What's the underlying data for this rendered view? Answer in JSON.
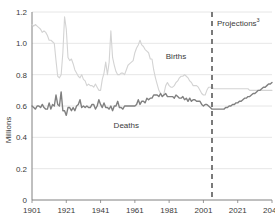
{
  "chart_data": {
    "type": "line",
    "title": "",
    "subtitle": "",
    "xlabel": "",
    "ylabel": "Millions",
    "xlim": [
      1901,
      2041
    ],
    "ylim": [
      0,
      1.2
    ],
    "grid": true,
    "grid_axis": "y",
    "legend": "inline-labels",
    "x_ticks": [
      "1901",
      "1921",
      "1941",
      "1961",
      "1981",
      "2001",
      "2021",
      "2041"
    ],
    "x_tick_values": [
      1901,
      1921,
      1941,
      1961,
      1981,
      2001,
      2021,
      2041
    ],
    "y_ticks": [
      "0",
      "0.2",
      "0.4",
      "0.6",
      "0.8",
      "1.0",
      "1.2"
    ],
    "y_tick_values": [
      0,
      0.2,
      0.4,
      0.6,
      0.8,
      1.0,
      1.2
    ],
    "annotations": [
      {
        "name": "projections-divider",
        "text": "Projections",
        "superscript": "3",
        "x": 2006,
        "style": "dashed-vertical",
        "color": "#7a7a7a"
      },
      {
        "name": "births-label",
        "text": "Births",
        "x": 1985,
        "y": 0.9,
        "color": "#3a3a3a"
      },
      {
        "name": "deaths-label",
        "text": "Deaths",
        "x": 1956,
        "y": 0.46,
        "color": "#3a3a3a"
      }
    ],
    "colors": {
      "births": "#d3d3d3",
      "deaths": "#808080",
      "grid": "#e0e0e0",
      "axis": "#808080",
      "text": "#3a3a3a",
      "background": "#ffffff"
    },
    "series": [
      {
        "name": "Births",
        "color": "#d3d3d3",
        "x": [
          1901,
          1902,
          1903,
          1904,
          1905,
          1906,
          1907,
          1908,
          1909,
          1910,
          1911,
          1912,
          1913,
          1914,
          1915,
          1916,
          1917,
          1918,
          1919,
          1920,
          1921,
          1922,
          1923,
          1924,
          1925,
          1926,
          1927,
          1928,
          1929,
          1930,
          1931,
          1932,
          1933,
          1934,
          1935,
          1936,
          1937,
          1938,
          1939,
          1940,
          1941,
          1942,
          1943,
          1944,
          1945,
          1946,
          1947,
          1948,
          1949,
          1950,
          1951,
          1952,
          1953,
          1954,
          1955,
          1956,
          1957,
          1958,
          1959,
          1960,
          1961,
          1962,
          1963,
          1964,
          1965,
          1966,
          1967,
          1968,
          1969,
          1970,
          1971,
          1972,
          1973,
          1974,
          1975,
          1976,
          1977,
          1978,
          1979,
          1980,
          1981,
          1982,
          1983,
          1984,
          1985,
          1986,
          1987,
          1988,
          1989,
          1990,
          1991,
          1992,
          1993,
          1994,
          1995,
          1996,
          1997,
          1998,
          1999,
          2000,
          2001,
          2002,
          2003,
          2004,
          2005,
          2006,
          2007,
          2008,
          2009,
          2010,
          2011,
          2012,
          2013,
          2014,
          2015,
          2016,
          2017,
          2018,
          2019,
          2020,
          2021,
          2022,
          2023,
          2024,
          2025,
          2026,
          2027,
          2028,
          2029,
          2030,
          2031,
          2032,
          2033,
          2034,
          2035,
          2036,
          2037,
          2038,
          2039,
          2040,
          2041
        ],
        "values": [
          1.12,
          1.11,
          1.12,
          1.11,
          1.1,
          1.09,
          1.07,
          1.08,
          1.07,
          1.05,
          1.02,
          1.02,
          1.01,
          1.0,
          0.89,
          0.79,
          0.78,
          0.8,
          0.94,
          1.17,
          1.09,
          0.91,
          0.89,
          0.9,
          0.87,
          0.83,
          0.81,
          0.79,
          0.78,
          0.8,
          0.77,
          0.76,
          0.73,
          0.74,
          0.73,
          0.73,
          0.72,
          0.74,
          0.72,
          0.7,
          0.7,
          0.77,
          0.81,
          0.88,
          0.8,
          0.88,
          1.08,
          0.91,
          0.86,
          0.82,
          0.8,
          0.8,
          0.81,
          0.81,
          0.8,
          0.83,
          0.86,
          0.87,
          0.88,
          0.89,
          0.94,
          0.97,
          0.99,
          1.02,
          0.99,
          0.98,
          0.96,
          0.95,
          0.94,
          0.9,
          0.9,
          0.83,
          0.78,
          0.74,
          0.7,
          0.68,
          0.66,
          0.68,
          0.73,
          0.75,
          0.73,
          0.72,
          0.72,
          0.73,
          0.75,
          0.76,
          0.78,
          0.79,
          0.79,
          0.8,
          0.79,
          0.78,
          0.76,
          0.75,
          0.73,
          0.73,
          0.73,
          0.72,
          0.7,
          0.68,
          0.67,
          0.67,
          0.7,
          0.72,
          0.72,
          0.72,
          0.71,
          0.71,
          0.71,
          0.71,
          0.71,
          0.71,
          0.71,
          0.71,
          0.71,
          0.71,
          0.71,
          0.71,
          0.71,
          0.71,
          0.71,
          0.71,
          0.71,
          0.71,
          0.71,
          0.71,
          0.71,
          0.7,
          0.7,
          0.7,
          0.7,
          0.7,
          0.7,
          0.7,
          0.7,
          0.7,
          0.7,
          0.7,
          0.7,
          0.7,
          0.7
        ]
      },
      {
        "name": "Deaths",
        "color": "#808080",
        "x": [
          1901,
          1902,
          1903,
          1904,
          1905,
          1906,
          1907,
          1908,
          1909,
          1910,
          1911,
          1912,
          1913,
          1914,
          1915,
          1916,
          1917,
          1918,
          1919,
          1920,
          1921,
          1922,
          1923,
          1924,
          1925,
          1926,
          1927,
          1928,
          1929,
          1930,
          1931,
          1932,
          1933,
          1934,
          1935,
          1936,
          1937,
          1938,
          1939,
          1940,
          1941,
          1942,
          1943,
          1944,
          1945,
          1946,
          1947,
          1948,
          1949,
          1950,
          1951,
          1952,
          1953,
          1954,
          1955,
          1956,
          1957,
          1958,
          1959,
          1960,
          1961,
          1962,
          1963,
          1964,
          1965,
          1966,
          1967,
          1968,
          1969,
          1970,
          1971,
          1972,
          1973,
          1974,
          1975,
          1976,
          1977,
          1978,
          1979,
          1980,
          1981,
          1982,
          1983,
          1984,
          1985,
          1986,
          1987,
          1988,
          1989,
          1990,
          1991,
          1992,
          1993,
          1994,
          1995,
          1996,
          1997,
          1998,
          1999,
          2000,
          2001,
          2002,
          2003,
          2004,
          2005,
          2006,
          2007,
          2008,
          2009,
          2010,
          2011,
          2012,
          2013,
          2014,
          2015,
          2016,
          2017,
          2018,
          2019,
          2020,
          2021,
          2022,
          2023,
          2024,
          2025,
          2026,
          2027,
          2028,
          2029,
          2030,
          2031,
          2032,
          2033,
          2034,
          2035,
          2036,
          2037,
          2038,
          2039,
          2040,
          2041
        ],
        "values": [
          0.6,
          0.59,
          0.58,
          0.6,
          0.6,
          0.59,
          0.61,
          0.59,
          0.58,
          0.58,
          0.62,
          0.58,
          0.61,
          0.6,
          0.67,
          0.61,
          0.6,
          0.69,
          0.57,
          0.57,
          0.54,
          0.59,
          0.59,
          0.57,
          0.59,
          0.57,
          0.6,
          0.61,
          0.64,
          0.59,
          0.6,
          0.59,
          0.6,
          0.59,
          0.59,
          0.61,
          0.61,
          0.58,
          0.6,
          0.64,
          0.61,
          0.59,
          0.62,
          0.59,
          0.59,
          0.58,
          0.6,
          0.57,
          0.6,
          0.6,
          0.63,
          0.59,
          0.59,
          0.58,
          0.6,
          0.6,
          0.6,
          0.6,
          0.6,
          0.6,
          0.6,
          0.61,
          0.64,
          0.61,
          0.63,
          0.63,
          0.62,
          0.65,
          0.64,
          0.65,
          0.65,
          0.67,
          0.67,
          0.67,
          0.66,
          0.68,
          0.66,
          0.67,
          0.68,
          0.66,
          0.66,
          0.66,
          0.66,
          0.65,
          0.67,
          0.66,
          0.65,
          0.65,
          0.66,
          0.64,
          0.65,
          0.63,
          0.65,
          0.63,
          0.64,
          0.64,
          0.63,
          0.63,
          0.63,
          0.61,
          0.6,
          0.61,
          0.61,
          0.6,
          0.59,
          0.58,
          0.58,
          0.58,
          0.58,
          0.58,
          0.58,
          0.58,
          0.58,
          0.59,
          0.59,
          0.6,
          0.6,
          0.61,
          0.61,
          0.62,
          0.62,
          0.63,
          0.63,
          0.64,
          0.65,
          0.65,
          0.66,
          0.66,
          0.67,
          0.68,
          0.68,
          0.69,
          0.7,
          0.7,
          0.71,
          0.72,
          0.72,
          0.73,
          0.74,
          0.74,
          0.75
        ]
      }
    ]
  }
}
